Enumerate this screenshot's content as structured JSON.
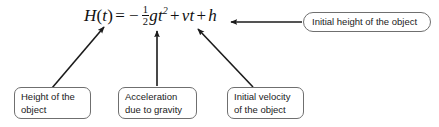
{
  "figure": {
    "background_color": "#ffffff",
    "ink_color": "#111111",
    "box_border_color": "#6f6f6f"
  },
  "equation": {
    "full_text": "H(t) = -1/2 g t^2 + v t + h",
    "lhs_function": "H",
    "lhs_open": "(",
    "lhs_var": "t",
    "lhs_close": ")",
    "equals": "=",
    "minus": "−",
    "fraction_numerator": "1",
    "fraction_denominator": "2",
    "gravity_symbol": "g",
    "time_symbol": "t",
    "time_exponent": "2",
    "plus_one": "+",
    "velocity_symbol": "v",
    "velocity_time_symbol": "t",
    "plus_two": "+",
    "height_symbol": "h"
  },
  "callouts": [
    {
      "id": "height",
      "lines": [
        "Height of the",
        "object"
      ],
      "points_to": "H(t)"
    },
    {
      "id": "acceleration",
      "lines": [
        "Acceleration",
        "due to gravity"
      ],
      "points_to": "g"
    },
    {
      "id": "velocity",
      "lines": [
        "Initial velocity",
        "of the object"
      ],
      "points_to": "vt"
    },
    {
      "id": "initial-height",
      "lines": [
        "Initial height of the object"
      ],
      "points_to": "h"
    }
  ],
  "arrows": [
    {
      "id": "arrow-to-ht",
      "from": [
        52,
        88
      ],
      "to": [
        104,
        27
      ]
    },
    {
      "id": "arrow-to-g",
      "from": [
        157,
        86
      ],
      "to": [
        157,
        31
      ]
    },
    {
      "id": "arrow-to-vt",
      "from": [
        253,
        87
      ],
      "to": [
        198,
        29
      ]
    },
    {
      "id": "arrow-to-h",
      "from": [
        302,
        22
      ],
      "to": [
        231,
        22
      ]
    }
  ]
}
